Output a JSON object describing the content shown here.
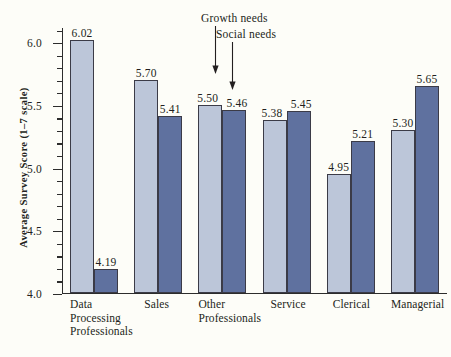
{
  "chart_data": {
    "type": "bar",
    "title": "",
    "xlabel": "",
    "ylabel": "Average Survey Score  (1–7 scale)",
    "ylim": [
      4.0,
      6.12
    ],
    "ytick_labels": [
      "6.0",
      "5.5",
      "5.0",
      "4.5",
      "4.0"
    ],
    "ytick_values": [
      6.0,
      5.5,
      5.0,
      4.5,
      4.0
    ],
    "grid": false,
    "legend_position": "annotated-arrows",
    "categories": [
      "Data Processing Professionals",
      "Sales",
      "Other Professionals",
      "Service",
      "Clerical",
      "Managerial"
    ],
    "category_lines": [
      [
        "Data",
        "Processing",
        "Professionals"
      ],
      [
        "Sales"
      ],
      [
        "Other",
        "Professionals"
      ],
      [
        "Service"
      ],
      [
        "Clerical"
      ],
      [
        "Managerial"
      ]
    ],
    "series": [
      {
        "name": "Growth needs",
        "color": "#bcc6d9",
        "values": [
          6.02,
          5.7,
          5.5,
          5.38,
          4.95,
          5.3
        ],
        "value_labels": [
          "6.02",
          "5.70",
          "5.50",
          "5.38",
          "4.95",
          "5.30"
        ]
      },
      {
        "name": "Social needs",
        "color": "#5f719f",
        "values": [
          4.19,
          5.41,
          5.46,
          5.45,
          5.21,
          5.65
        ],
        "value_labels": [
          "4.19",
          "5.41",
          "5.46",
          "5.45",
          "5.21",
          "5.65"
        ]
      }
    ],
    "annotations": [
      {
        "label": "Growth needs",
        "points_to": "Other Professionals / Growth needs bar"
      },
      {
        "label": "Social needs",
        "points_to": "Other Professionals / Social needs bar"
      }
    ]
  }
}
